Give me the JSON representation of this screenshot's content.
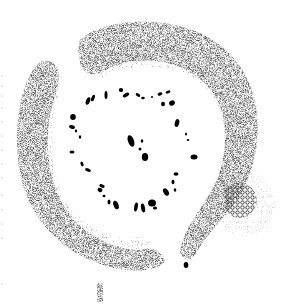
{
  "figure": {
    "kind": "stippled plan illustration",
    "width": 285,
    "height": 308,
    "background": "#ffffff",
    "ink": "#111111",
    "colors": {
      "bank_outer": "#2a2a2a",
      "bank_inner": "#bdbdbd",
      "bank_fill": "#d9d9d9",
      "cluster": "#444444",
      "cluster_halo": "#e6e6e6",
      "stones": "#000000"
    },
    "elements": [
      {
        "name": "left-bank",
        "description": "Large curved stippled bank on the left and bottom"
      },
      {
        "name": "upper-right-bank",
        "description": "Curved stippled bank across top and right"
      },
      {
        "name": "cellular-cluster",
        "description": "Small honeycomb-textured mound at lower right"
      },
      {
        "name": "stone-ring",
        "description": "Ring of black stone fragments in the central clearing"
      },
      {
        "name": "central-stones",
        "description": "Cluster of black stones at the centre"
      },
      {
        "name": "bottom-stub",
        "description": "Small stippled post at bottom centre"
      },
      {
        "name": "edge-dots",
        "description": "Faint dotted margin along left edge"
      }
    ]
  }
}
